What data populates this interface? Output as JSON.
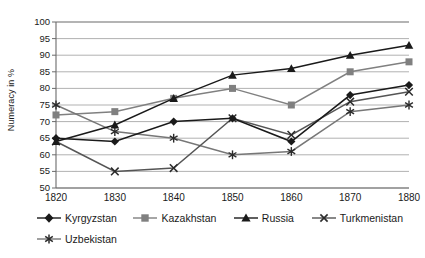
{
  "chart_data": {
    "type": "line",
    "title": "",
    "xlabel": "",
    "ylabel": "Numeracy in %",
    "categories": [
      "1820",
      "1830",
      "1840",
      "1850",
      "1860",
      "1870",
      "1880"
    ],
    "x": [
      1820,
      1830,
      1840,
      1850,
      1860,
      1870,
      1880
    ],
    "ylim": [
      50,
      100
    ],
    "yticks": [
      50,
      55,
      60,
      65,
      70,
      75,
      80,
      85,
      90,
      95,
      100
    ],
    "grid": "horizontal",
    "legend_position": "bottom",
    "series": [
      {
        "name": "Kyrgyzstan",
        "marker": "diamond",
        "color": "#1a1a1a",
        "values": [
          65,
          64,
          70,
          71,
          64,
          78,
          81
        ]
      },
      {
        "name": "Kazakhstan",
        "marker": "square",
        "color": "#808080",
        "values": [
          72,
          73,
          77,
          80,
          75,
          85,
          88
        ]
      },
      {
        "name": "Russia",
        "marker": "triangle",
        "color": "#1a1a1a",
        "values": [
          64,
          69,
          77,
          84,
          86,
          90,
          93
        ]
      },
      {
        "name": "Turkmenistan",
        "marker": "x",
        "color": "#555555",
        "values": [
          64,
          55,
          56,
          71,
          66,
          76,
          79
        ]
      },
      {
        "name": "Uzbekistan",
        "marker": "asterisk",
        "color": "#777777",
        "values": [
          75,
          67,
          65,
          60,
          61,
          73,
          75
        ]
      }
    ]
  },
  "axes": {
    "ytick_labels": [
      "100",
      "95",
      "90",
      "85",
      "80",
      "75",
      "70",
      "65",
      "60",
      "55",
      "50"
    ],
    "xtick_labels": [
      "1820",
      "1830",
      "1840",
      "1850",
      "1860",
      "1870",
      "1880"
    ]
  },
  "legend": {
    "items": [
      {
        "label": "Kyrgyzstan",
        "marker": "diamond-marker-icon"
      },
      {
        "label": "Kazakhstan",
        "marker": "square-marker-icon"
      },
      {
        "label": "Russia",
        "marker": "triangle-marker-icon"
      },
      {
        "label": "Turkmenistan",
        "marker": "x-marker-icon"
      },
      {
        "label": "Uzbekistan",
        "marker": "asterisk-marker-icon"
      }
    ]
  },
  "colors": {
    "axis": "#6b6b6b",
    "grid": "#a8a8a8",
    "text": "#1a1a1a",
    "dark_series": "#1a1a1a",
    "light_series": "#808080"
  }
}
